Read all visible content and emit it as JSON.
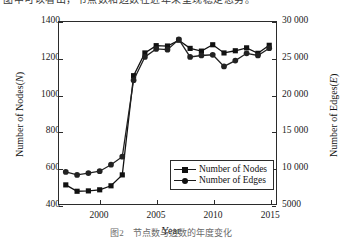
{
  "page": {
    "top_text": "图中可以看出，节点数和边数在近年来呈现稳定态势。",
    "caption": "图2　节点数与边数的年度变化"
  },
  "chart_data": {
    "type": "line",
    "title": "",
    "xlabel": "Year",
    "ylabel": "Number of Nodes(N)",
    "y2label": "Number of Edges(E)",
    "xlim": [
      1996.4,
      2015.6
    ],
    "ylim": [
      400,
      1400
    ],
    "y2lim": [
      5000,
      30000
    ],
    "xticks": [
      2000,
      2005,
      2010,
      2015
    ],
    "yticks": [
      400,
      600,
      800,
      1000,
      1200,
      1400
    ],
    "yticklabels": [
      "400",
      "600",
      "800",
      "1000",
      "1200",
      "1400"
    ],
    "y2ticks": [
      5000,
      10000,
      15000,
      20000,
      25000,
      30000
    ],
    "y2ticklabels": [
      "5000",
      "10 000",
      "15 000",
      "20 000",
      "25 000",
      "30 000"
    ],
    "grid": false,
    "legend_position": "lower right",
    "x": [
      1997,
      1998,
      1999,
      2000,
      2001,
      2002,
      2003,
      2004,
      2005,
      2006,
      2007,
      2008,
      2009,
      2010,
      2011,
      2012,
      2013,
      2014,
      2015
    ],
    "series": [
      {
        "name": "Number of Nodes",
        "marker": "square",
        "axis": "left",
        "color": "#111111",
        "values": [
          505,
          470,
          472,
          478,
          500,
          560,
          1105,
          1230,
          1270,
          1268,
          1300,
          1255,
          1240,
          1275,
          1230,
          1242,
          1258,
          1228,
          1272
        ]
      },
      {
        "name": "Number of Edges",
        "marker": "circle",
        "axis": "right",
        "color": "#222222",
        "values": [
          9400,
          9000,
          9250,
          9500,
          10400,
          11500,
          22000,
          25200,
          26300,
          26200,
          27600,
          25200,
          25400,
          25500,
          23900,
          24700,
          25700,
          25400,
          26400
        ]
      }
    ],
    "legend": [
      "Number of Nodes",
      "Number of Edges"
    ]
  }
}
